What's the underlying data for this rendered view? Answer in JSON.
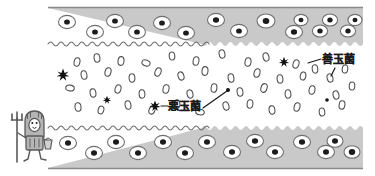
{
  "figure": {
    "kind": "hand-drawn-illustration",
    "colors": {
      "wall_fill": "#c9c9c9",
      "wall_outline": "#8a8a8a",
      "lumen_fill": "#ffffff",
      "cell_fill": "#ffffff",
      "cell_outline": "#6f6f6f",
      "nucleus": "#1c1c1c",
      "good_bacteria_outline": "#4d4d4d",
      "bad_bacteria": "#111111",
      "mascot_fill": "#b4b4b4",
      "mascot_outline": "#5a5a5a",
      "text": "#1a1a1a",
      "leader_line": "#1a1a1a"
    },
    "labels": {
      "good_bacteria": "善玉菌",
      "bad_bacteria": "悪玉菌"
    },
    "mascot": {
      "name": "devil-bacteria-mascot",
      "holds": "pitchfork",
      "carries": "basket"
    },
    "wall_cells": {
      "top_count": 16,
      "bottom_count": 16
    },
    "lumen_contents": {
      "good_bacteria_count": 46,
      "bad_bacteria_count": 4,
      "dot_count": 3
    }
  }
}
